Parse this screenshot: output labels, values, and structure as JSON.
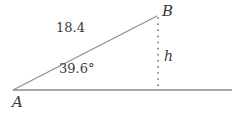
{
  "diagram": {
    "type": "right-triangle-trigonometry",
    "background_color": "#ffffff",
    "line_color": "#8c8c8c",
    "text_color": "#3a3a3a",
    "labels": {
      "vertex_a": "A",
      "vertex_b": "B",
      "side_ab_length": "18.4",
      "angle_at_a": "39.6°",
      "height_label": "h"
    },
    "geometry": {
      "vertex_a": {
        "x": 13,
        "y": 90
      },
      "vertex_b": {
        "x": 157,
        "y": 16
      },
      "foot_of_height": {
        "x": 158,
        "y": 90
      },
      "baseline_end": {
        "x": 232,
        "y": 90
      }
    },
    "elements": {
      "hypotenuse_name": "segment-ab",
      "baseline_name": "horizontal-baseline",
      "height_name": "dotted-height-segment"
    }
  }
}
